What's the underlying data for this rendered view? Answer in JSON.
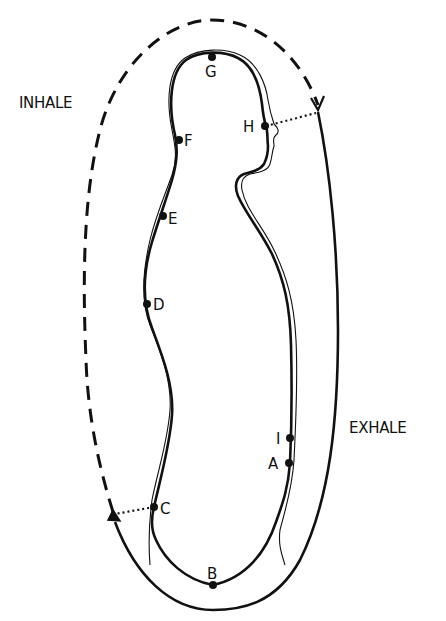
{
  "diagram": {
    "background": "#ffffff",
    "ink": "#111111",
    "side_labels": {
      "inhale": "INHALE",
      "exhale": "EXHALE"
    },
    "points": [
      {
        "id": "A",
        "label": "A",
        "x": 289,
        "y": 463,
        "lx": 270,
        "ly": 469
      },
      {
        "id": "B",
        "label": "B",
        "x": 213,
        "y": 585,
        "lx": 206,
        "ly": 579
      },
      {
        "id": "C",
        "label": "C",
        "x": 154,
        "y": 507,
        "lx": 161,
        "ly": 514
      },
      {
        "id": "D",
        "label": "D",
        "x": 147,
        "y": 304,
        "lx": 154,
        "ly": 310
      },
      {
        "id": "E",
        "label": "E",
        "x": 163,
        "y": 216,
        "lx": 169,
        "ly": 225
      },
      {
        "id": "F",
        "label": "F",
        "x": 179,
        "y": 140,
        "lx": 185,
        "ly": 146
      },
      {
        "id": "G",
        "label": "G",
        "x": 212,
        "y": 57,
        "lx": 205,
        "ly": 77
      },
      {
        "id": "H",
        "label": "H",
        "x": 265,
        "y": 126,
        "lx": 243,
        "ly": 132
      },
      {
        "id": "I",
        "label": "I",
        "x": 290,
        "y": 438,
        "lx": 276,
        "ly": 444
      }
    ]
  }
}
